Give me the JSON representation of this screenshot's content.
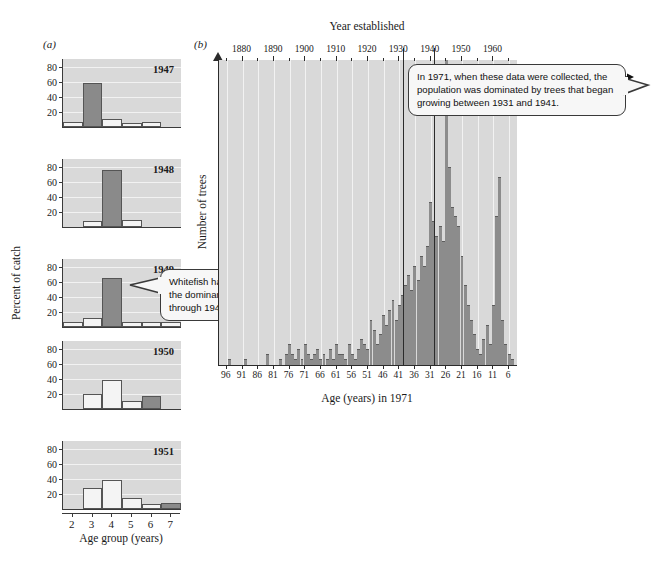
{
  "figure": {
    "panel_a_letter": "(a)",
    "panel_b_letter": "(b)"
  },
  "panel_a": {
    "ylabel": "Percent of catch",
    "xlabel": "Age group (years)",
    "yticks": [
      20,
      40,
      60,
      80
    ],
    "xticks": [
      2,
      3,
      4,
      5,
      6,
      7
    ],
    "ylim": [
      0,
      90
    ],
    "callout": "Whitefish hatched in 1944 were the dominant age group caught through 1949.",
    "charts": [
      {
        "type": "bar",
        "title": "1947",
        "categories": [
          2,
          3,
          4,
          5,
          6,
          7
        ],
        "values": [
          6,
          58,
          10,
          5,
          6,
          0
        ],
        "highlight_index": 1,
        "xlabel": "",
        "ylabel": "Percent of catch",
        "ylim": [
          0,
          90
        ]
      },
      {
        "type": "bar",
        "title": "1948",
        "categories": [
          2,
          3,
          4,
          5,
          6,
          7
        ],
        "values": [
          0,
          8,
          76,
          9,
          0,
          0
        ],
        "highlight_index": 2,
        "xlabel": "",
        "ylabel": "Percent of catch",
        "ylim": [
          0,
          90
        ]
      },
      {
        "type": "bar",
        "title": "1949",
        "categories": [
          2,
          3,
          4,
          5,
          6,
          7
        ],
        "values": [
          7,
          12,
          65,
          6,
          6,
          6
        ],
        "highlight_index": 2,
        "xlabel": "",
        "ylabel": "Percent of catch",
        "ylim": [
          0,
          90
        ]
      },
      {
        "type": "bar",
        "title": "1950",
        "categories": [
          2,
          3,
          4,
          5,
          6,
          7
        ],
        "values": [
          0,
          20,
          38,
          11,
          17,
          0
        ],
        "highlight_index": 4,
        "xlabel": "",
        "ylabel": "Percent of catch",
        "ylim": [
          0,
          90
        ]
      },
      {
        "type": "bar",
        "title": "1951",
        "categories": [
          2,
          3,
          4,
          5,
          6,
          7
        ],
        "values": [
          0,
          28,
          38,
          14,
          6,
          8
        ],
        "highlight_index": 5,
        "xlabel": "",
        "ylabel": "Percent of catch",
        "ylim": [
          0,
          90
        ]
      }
    ]
  },
  "panel_b": {
    "top_axis_title": "Year established",
    "bottom_axis_title": "Age (years) in 1971",
    "ylabel": "Number of trees",
    "top_ticks": [
      1870,
      1880,
      1890,
      1900,
      1910,
      1920,
      1930,
      1940,
      1950,
      1960
    ],
    "bottom_ticks": [
      96,
      91,
      86,
      81,
      76,
      71,
      66,
      61,
      56,
      51,
      46,
      41,
      36,
      31,
      26,
      21,
      16,
      11,
      6
    ],
    "callout": "In 1971, when these data were collected, the population was dominated by trees that began growing between 1931 and 1941.",
    "reference_years": [
      1931,
      1941
    ],
    "chart_data": {
      "type": "bar",
      "title": "Age structure of tree population in 1971",
      "xlabel": "Age (years) in 1971",
      "xlabel_secondary": "Year established",
      "ylabel": "Number of trees",
      "x_is_age_descending": true,
      "age_range": [
        98,
        4
      ],
      "ylim": [
        0,
        62
      ],
      "grid": "vertical",
      "bar_color": "#8c8c8c",
      "ages": [
        98,
        97,
        96,
        95,
        94,
        93,
        92,
        91,
        90,
        89,
        88,
        87,
        86,
        85,
        84,
        83,
        82,
        81,
        80,
        79,
        78,
        77,
        76,
        75,
        74,
        73,
        72,
        71,
        70,
        69,
        68,
        67,
        66,
        65,
        64,
        63,
        62,
        61,
        60,
        59,
        58,
        57,
        56,
        55,
        54,
        53,
        52,
        51,
        50,
        49,
        48,
        47,
        46,
        45,
        44,
        43,
        42,
        41,
        40,
        39,
        38,
        37,
        36,
        35,
        34,
        33,
        32,
        31,
        30,
        29,
        28,
        27,
        26,
        25,
        24,
        23,
        22,
        21,
        20,
        19,
        18,
        17,
        16,
        15,
        14,
        13,
        12,
        11,
        10,
        9,
        8,
        7,
        6,
        5,
        4
      ],
      "values": [
        0,
        0,
        0,
        1,
        0,
        0,
        0,
        0,
        1,
        0,
        0,
        0,
        0,
        0,
        0,
        2,
        0,
        0,
        0,
        1,
        0,
        2,
        4,
        2,
        1,
        3,
        1,
        4,
        2,
        1,
        2,
        3,
        1,
        2,
        1,
        3,
        1,
        4,
        2,
        2,
        1,
        4,
        2,
        1,
        3,
        5,
        4,
        3,
        9,
        7,
        4,
        6,
        10,
        8,
        11,
        13,
        9,
        12,
        14,
        16,
        18,
        15,
        20,
        17,
        22,
        20,
        24,
        33,
        29,
        26,
        28,
        25,
        62,
        40,
        32,
        30,
        28,
        22,
        16,
        12,
        9,
        6,
        3,
        2,
        5,
        8,
        4,
        12,
        30,
        38,
        9,
        4,
        2,
        1,
        0
      ]
    }
  },
  "colors": {
    "plot_background": "#d9d9d9",
    "bar_dark": "#8c8c8c",
    "bar_white": "#f4f4f4",
    "axis": "#2b2b2b",
    "gridline": "#f2f2f2"
  }
}
